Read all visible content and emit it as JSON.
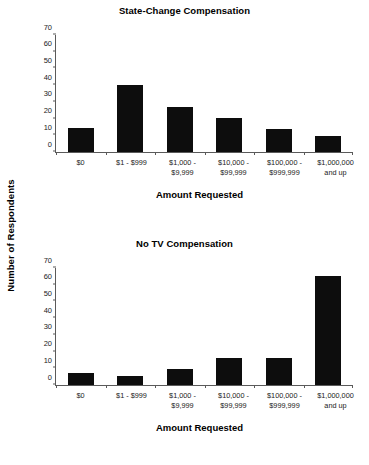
{
  "y_axis_title": "Number of Respondents",
  "chart_data": [
    {
      "type": "bar",
      "title": "State-Change Compensation",
      "xlabel": "Amount Requested",
      "ylabel": "Number of Respondents",
      "categories": [
        "$0",
        "$1 - $999",
        "$1,000 -\n$9,999",
        "$10,000 -\n$99,999",
        "$100,000 -\n$999,999",
        "$1,000,000\nand up"
      ],
      "values": [
        14.5,
        40,
        27,
        20.5,
        14,
        9.5
      ],
      "yticks": [
        0,
        10,
        20,
        30,
        40,
        50,
        60,
        70
      ],
      "ylim": [
        0,
        70
      ],
      "grid": false,
      "legend": "none",
      "bar_color": "#0d0d0d"
    },
    {
      "type": "bar",
      "title": "No TV Compensation",
      "xlabel": "Amount Requested",
      "ylabel": "Number of Respondents",
      "categories": [
        "$0",
        "$1 - $999",
        "$1,000 -\n$9,999",
        "$10,000 -\n$99,999",
        "$100,000 -\n$999,999",
        "$1,000,000\nand up"
      ],
      "values": [
        7,
        5.5,
        9.5,
        16,
        16.3,
        65.5
      ],
      "yticks": [
        0,
        10,
        20,
        30,
        40,
        50,
        60,
        70
      ],
      "ylim": [
        0,
        70
      ],
      "grid": false,
      "legend": "none",
      "bar_color": "#0d0d0d"
    }
  ]
}
